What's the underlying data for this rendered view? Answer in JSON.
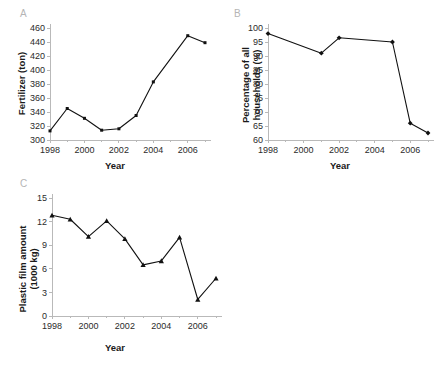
{
  "figure": {
    "background": "#ffffff",
    "line_color": "#111111",
    "axis_color": "#b9b9b9",
    "panel_letter_color": "#b5b5b5"
  },
  "panels": [
    {
      "letter": "A",
      "xlabel": "Year",
      "ylabel": "Fertilizer (ton)"
    },
    {
      "letter": "B",
      "xlabel": "Year",
      "ylabel_line1": "Percentage of all",
      "ylabel_line2": "households (%)"
    },
    {
      "letter": "C",
      "xlabel": "Year",
      "ylabel_line1": "Plastic film amount",
      "ylabel_line2": "(1000 kg)"
    }
  ],
  "chart_data": [
    {
      "type": "line",
      "panel": "A",
      "title": "",
      "xlabel": "Year",
      "ylabel": "Fertilizer (ton)",
      "marker": "square",
      "grid": false,
      "legend": "none",
      "xlim": [
        1998,
        2007
      ],
      "ylim": [
        300,
        460
      ],
      "ytick_step": 20,
      "xtick_labels": [
        "1998",
        "2000",
        "2002",
        "2004",
        "2006"
      ],
      "xtick_values": [
        1998,
        2000,
        2002,
        2004,
        2006
      ],
      "ytick_labels": [
        "300",
        "320",
        "340",
        "360",
        "380",
        "400",
        "420",
        "440",
        "460"
      ],
      "ytick_values": [
        300,
        320,
        340,
        360,
        380,
        400,
        420,
        440,
        460
      ],
      "x": [
        1998,
        1999,
        2000,
        2001,
        2002,
        2003,
        2004,
        2006,
        2007
      ],
      "values": [
        313,
        345,
        331,
        314,
        316,
        335,
        383,
        449,
        439
      ]
    },
    {
      "type": "line",
      "panel": "B",
      "title": "",
      "xlabel": "Year",
      "ylabel": "Percentage of all households (%)",
      "marker": "diamond",
      "grid": false,
      "legend": "none",
      "xlim": [
        1998,
        2007
      ],
      "ylim": [
        60,
        100
      ],
      "ytick_step": 5,
      "xtick_labels": [
        "1998",
        "2000",
        "2002",
        "2004",
        "2006"
      ],
      "xtick_values": [
        1998,
        2000,
        2002,
        2004,
        2006
      ],
      "ytick_labels": [
        "60",
        "65",
        "70",
        "75",
        "80",
        "85",
        "90",
        "95",
        "100"
      ],
      "ytick_values": [
        60,
        65,
        70,
        75,
        80,
        85,
        90,
        95,
        100
      ],
      "x": [
        1998,
        2001,
        2002,
        2005,
        2006,
        2007
      ],
      "values": [
        98,
        91,
        96.5,
        95,
        66,
        62.5
      ]
    },
    {
      "type": "line",
      "panel": "C",
      "title": "",
      "xlabel": "Year",
      "ylabel": "Plastic film amount (1000 kg)",
      "marker": "triangle",
      "grid": false,
      "legend": "none",
      "xlim": [
        1998,
        2007
      ],
      "ylim": [
        0,
        15
      ],
      "ytick_step": 3,
      "xtick_labels": [
        "1998",
        "2000",
        "2002",
        "2004",
        "2006"
      ],
      "xtick_values": [
        1998,
        2000,
        2002,
        2004,
        2006
      ],
      "ytick_labels": [
        "0",
        "3",
        "6",
        "9",
        "12",
        "15"
      ],
      "ytick_values": [
        0,
        3,
        6,
        9,
        12,
        15
      ],
      "x": [
        1998,
        1999,
        2000,
        2001,
        2002,
        2003,
        2004,
        2005,
        2006,
        2007
      ],
      "values": [
        12.8,
        12.3,
        10.1,
        12.1,
        9.8,
        6.5,
        7.0,
        10.0,
        2.1,
        4.8
      ]
    }
  ]
}
